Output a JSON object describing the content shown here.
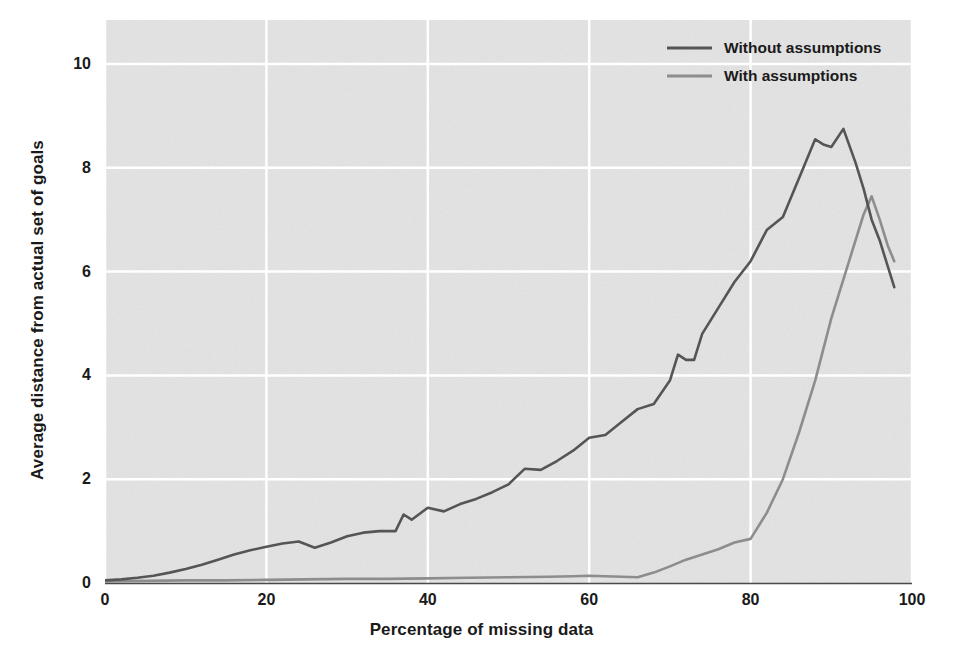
{
  "chart_data": {
    "type": "line",
    "title": "",
    "subtitle": "",
    "xlabel": "Percentage of missing data",
    "ylabel": "Average distance from actual set of goals",
    "xlim": [
      0,
      100
    ],
    "ylim": [
      0,
      11
    ],
    "xticks": [
      0,
      20,
      40,
      60,
      80,
      100
    ],
    "xtick_labels": [
      "0",
      "20",
      "40",
      "60",
      "80",
      "100"
    ],
    "yticks": [
      0,
      2,
      4,
      6,
      8,
      10
    ],
    "ytick_labels": [
      "0",
      "2",
      "4",
      "6",
      "8",
      "10"
    ],
    "grid": true,
    "grid_color": "#ffffff",
    "plot_background": "#e3e3e3",
    "figure_background": "#ffffff",
    "legend": {
      "position": "top-right",
      "entries": [
        {
          "label": "Without assumptions",
          "color": "#555555"
        },
        {
          "label": "With assumptions",
          "color": "#8d8d8d"
        }
      ]
    },
    "series": [
      {
        "name": "Without assumptions",
        "color": "#555555",
        "linewidth": 2.6,
        "x": [
          0,
          2,
          4,
          6,
          8,
          10,
          12,
          14,
          16,
          18,
          20,
          22,
          24,
          26,
          28,
          30,
          32,
          34,
          36,
          37,
          38,
          40,
          42,
          44,
          46,
          48,
          50,
          52,
          54,
          56,
          58,
          60,
          62,
          64,
          66,
          68,
          70,
          71,
          72,
          73,
          74,
          76,
          78,
          80,
          82,
          84,
          86,
          88,
          89,
          90,
          91.5,
          93,
          94,
          95,
          96,
          97,
          97.8
        ],
        "y": [
          0.05,
          0.07,
          0.1,
          0.14,
          0.2,
          0.27,
          0.35,
          0.45,
          0.55,
          0.63,
          0.7,
          0.76,
          0.8,
          0.68,
          0.78,
          0.9,
          0.97,
          1.0,
          1.0,
          1.32,
          1.22,
          1.45,
          1.38,
          1.52,
          1.62,
          1.75,
          1.9,
          2.2,
          2.18,
          2.35,
          2.55,
          2.8,
          2.85,
          3.1,
          3.35,
          3.45,
          3.9,
          4.4,
          4.3,
          4.3,
          4.8,
          5.3,
          5.8,
          6.2,
          6.8,
          7.05,
          7.8,
          8.55,
          8.45,
          8.4,
          8.75,
          8.1,
          7.6,
          7.0,
          6.6,
          6.1,
          5.7
        ]
      },
      {
        "name": "With assumptions",
        "color": "#8d8d8d",
        "linewidth": 2.6,
        "x": [
          0,
          5,
          10,
          15,
          20,
          25,
          30,
          35,
          40,
          45,
          50,
          55,
          58,
          60,
          62,
          64,
          66,
          68,
          70,
          72,
          74,
          76,
          78,
          80,
          82,
          84,
          86,
          88,
          90,
          92,
          94,
          95,
          96,
          97,
          97.8
        ],
        "y": [
          0.03,
          0.04,
          0.05,
          0.05,
          0.06,
          0.07,
          0.08,
          0.08,
          0.09,
          0.1,
          0.11,
          0.12,
          0.13,
          0.14,
          0.13,
          0.12,
          0.11,
          0.2,
          0.32,
          0.45,
          0.55,
          0.65,
          0.78,
          0.85,
          1.35,
          2.0,
          2.9,
          3.9,
          5.1,
          6.1,
          7.1,
          7.45,
          7.0,
          6.5,
          6.2
        ]
      }
    ]
  },
  "axes": {
    "xlabel": "Percentage of missing data",
    "ylabel": "Average distance from actual set of goals"
  },
  "legend_labels": {
    "without": "Without assumptions",
    "with": "With assumptions"
  }
}
